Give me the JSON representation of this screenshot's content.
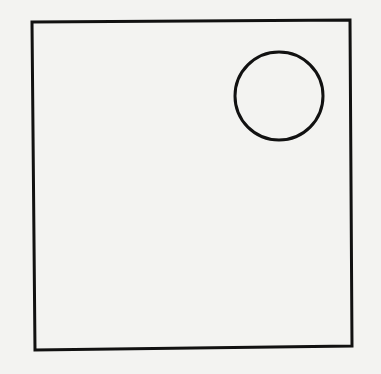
{
  "figure": {
    "background_color": "#f3f3f1",
    "stroke_color": "#111111",
    "shapes": [
      {
        "type": "square",
        "label": "outer-square",
        "points": [
          [
            32,
            22
          ],
          [
            350,
            20
          ],
          [
            352,
            346
          ],
          [
            35,
            350
          ]
        ],
        "stroke_width": 3
      },
      {
        "type": "circle",
        "label": "inner-circle",
        "cx": 279,
        "cy": 96,
        "r": 44,
        "stroke_width": 3
      }
    ]
  }
}
